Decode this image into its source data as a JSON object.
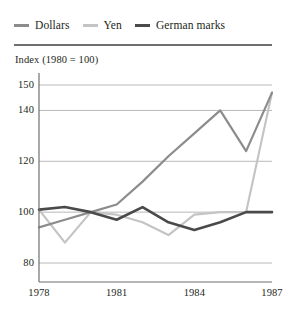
{
  "legend": {
    "position": "top-left",
    "entries": [
      {
        "label": "Dollars",
        "color": "#8c8c8c",
        "icon": "line-swatch-icon"
      },
      {
        "label": "Yen",
        "color": "#c4c4c4",
        "icon": "line-swatch-icon"
      },
      {
        "label": "German marks",
        "color": "#4a4a4a",
        "icon": "line-swatch-icon"
      }
    ]
  },
  "chart_data": {
    "type": "line",
    "title": "Index (1980 = 100)",
    "xlabel": "",
    "ylabel": "",
    "xlim": [
      1978,
      1987
    ],
    "ylim": [
      75,
      152
    ],
    "grid": true,
    "gridlines": [
      80,
      100,
      120,
      140,
      150
    ],
    "yticks": [
      150,
      140,
      120,
      100,
      80
    ],
    "ytick_labels": [
      "150",
      "140",
      "120",
      "100",
      "80"
    ],
    "xticks": [
      1978,
      1981,
      1984,
      1987
    ],
    "xtick_labels": [
      "1978",
      "1981",
      "1984",
      "1987"
    ],
    "x": [
      1978,
      1979,
      1980,
      1981,
      1982,
      1983,
      1984,
      1985,
      1986,
      1987
    ],
    "series": [
      {
        "name": "Dollars",
        "color": "#8c8c8c",
        "values": [
          94,
          97,
          100,
          103,
          112,
          122,
          131,
          140,
          124,
          147
        ]
      },
      {
        "name": "Yen",
        "color": "#c4c4c4",
        "values": [
          101,
          88,
          100,
          99,
          96,
          91,
          99,
          100,
          100,
          147
        ]
      },
      {
        "name": "German marks",
        "color": "#4a4a4a",
        "values": [
          101,
          102,
          100,
          97,
          102,
          96,
          93,
          96,
          100,
          100
        ]
      }
    ]
  },
  "colors": {
    "rule": "#6f6f6f",
    "grid": "#b8b8b8",
    "axis": "#6f6f6f",
    "text": "#231f20",
    "background": "#ffffff"
  }
}
